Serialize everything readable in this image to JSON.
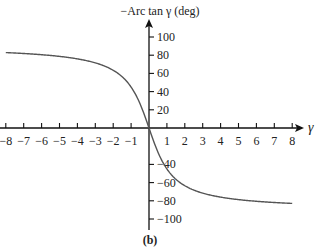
{
  "chart_data": {
    "type": "line",
    "title": "",
    "xlabel": "γ",
    "ylabel": "−Arc tan γ (deg)",
    "caption": "(b)",
    "xlim": [
      -8,
      8
    ],
    "ylim": [
      -100,
      100
    ],
    "x_ticks": [
      -8,
      -7,
      -6,
      -5,
      -4,
      -3,
      -2,
      -1,
      1,
      2,
      3,
      4,
      5,
      6,
      7,
      8
    ],
    "x_tick_labels": [
      "−8",
      "−7",
      "−6",
      "−5",
      "−4",
      "−3",
      "−2",
      "−1",
      "1",
      "2",
      "3",
      "4",
      "5",
      "6",
      "7",
      "8"
    ],
    "y_ticks": [
      100,
      80,
      60,
      40,
      20,
      -40,
      -60,
      -80,
      -100
    ],
    "y_tick_labels": [
      "100",
      "80",
      "60",
      "40",
      "20",
      "−40",
      "−60",
      "−80",
      "−100"
    ],
    "grid": false,
    "series": [
      {
        "name": "−Arc tan γ",
        "x": [
          -8,
          -7,
          -6,
          -5,
          -4,
          -3,
          -2,
          -1,
          -0.5,
          0,
          0.5,
          1,
          2,
          3,
          4,
          5,
          6,
          7,
          8
        ],
        "values": [
          82.9,
          81.9,
          80.5,
          78.7,
          76.0,
          71.6,
          63.4,
          45.0,
          26.6,
          0,
          -26.6,
          -45.0,
          -63.4,
          -71.6,
          -76.0,
          -78.7,
          -80.5,
          -81.9,
          -82.9
        ]
      }
    ],
    "colors": {
      "curve": "#555555",
      "axes": "#111111"
    }
  }
}
